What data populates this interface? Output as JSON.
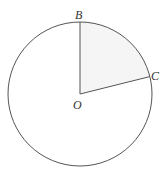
{
  "diagram": {
    "type": "circle-sector",
    "circle": {
      "center": "O",
      "cx": 80,
      "cy": 94,
      "r": 72
    },
    "points": [
      {
        "id": "B",
        "label": "B",
        "x": 80,
        "y": 22
      },
      {
        "id": "C",
        "label": "C",
        "x": 149,
        "y": 77
      },
      {
        "id": "O",
        "label": "O",
        "x": 80,
        "y": 94
      }
    ],
    "segments": [
      [
        "O",
        "B"
      ],
      [
        "O",
        "C"
      ]
    ],
    "shaded_sector": {
      "from": "B",
      "to": "C",
      "fill": "#f6f6f6"
    },
    "colors": {
      "stroke": "#555555",
      "label": "#333333"
    }
  }
}
